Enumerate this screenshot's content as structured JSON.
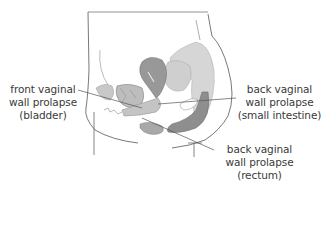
{
  "diagram": {
    "type": "anatomical-cross-section",
    "colors": {
      "outline": "#555555",
      "organ_light": "#d4d4d4",
      "organ_mid": "#a9a9a9",
      "organ_dark": "#8c8c8c",
      "leader_line": "#555555",
      "text": "#3a3a3a",
      "background": "#ffffff"
    },
    "labels": [
      {
        "id": "front-vaginal-wall-prolapse",
        "lines": [
          "front vaginal",
          "wall prolapse",
          "(bladder)"
        ]
      },
      {
        "id": "back-vaginal-wall-prolapse-small-intestine",
        "lines": [
          "back vaginal",
          "wall prolapse",
          "(small intestine)"
        ]
      },
      {
        "id": "back-vaginal-wall-prolapse-rectum",
        "lines": [
          "back vaginal",
          "wall prolapse",
          "(rectum)"
        ]
      }
    ]
  }
}
